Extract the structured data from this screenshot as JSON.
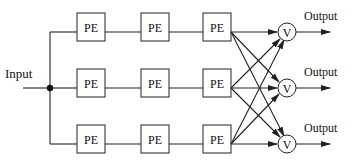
{
  "diagram": {
    "input_label": "Input",
    "pe_label": "PE",
    "voter_label": "V",
    "output_label": "Output",
    "rows": [
      {
        "id": "row-1",
        "pe": [
          "PE",
          "PE",
          "PE"
        ],
        "voter": "V",
        "output": "Output"
      },
      {
        "id": "row-2",
        "pe": [
          "PE",
          "PE",
          "PE"
        ],
        "voter": "V",
        "output": "Output"
      },
      {
        "id": "row-3",
        "pe": [
          "PE",
          "PE",
          "PE"
        ],
        "voter": "V",
        "output": "Output"
      }
    ]
  }
}
